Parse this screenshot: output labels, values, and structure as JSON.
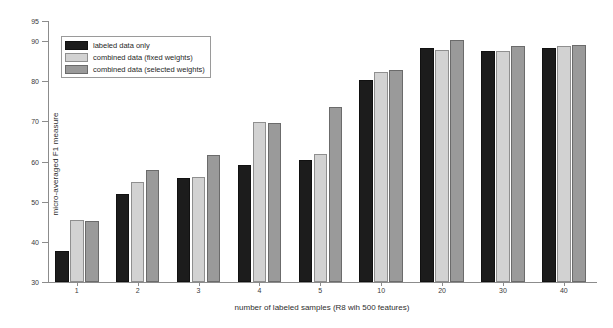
{
  "chart_data": {
    "type": "bar",
    "title": "",
    "xlabel": "number of labeled samples (R8 wih 500 features)",
    "ylabel": "micro-averaged F1 measure",
    "categories": [
      "1",
      "2",
      "3",
      "4",
      "5",
      "10",
      "20",
      "30",
      "40"
    ],
    "series": [
      {
        "name": "labeled data only",
        "color": "#1c1c1c",
        "values": [
          37.8,
          52.0,
          55.8,
          59.2,
          60.3,
          80.4,
          88.4,
          87.6,
          88.3
        ]
      },
      {
        "name": "combined data (fixed weights)",
        "color": "#d2d2d2",
        "values": [
          45.4,
          54.8,
          56.1,
          69.8,
          62.0,
          82.2,
          87.7,
          87.6,
          88.9
        ]
      },
      {
        "name": "combined data (selected weights)",
        "color": "#9a9a9a",
        "values": [
          45.3,
          58.0,
          61.6,
          69.7,
          73.5,
          82.8,
          90.2,
          88.8,
          89.1
        ]
      }
    ],
    "ylim": [
      30,
      95
    ],
    "yticks": [
      95,
      90,
      80,
      70,
      60,
      50,
      40,
      30
    ],
    "grid": false,
    "legend_position": "upper-left"
  },
  "legend": {
    "entries": [
      "labeled data only",
      "combined data (fixed weights)",
      "combined data (selected weights)"
    ]
  },
  "colors": {
    "series_labeled_only": "#1c1c1c",
    "series_fixed_weights": "#d2d2d2",
    "series_selected_weights": "#9a9a9a",
    "axis": "#8c8c8c",
    "background": "#ffffff"
  }
}
